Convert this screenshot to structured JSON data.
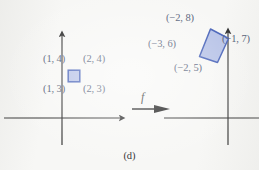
{
  "figure": {
    "caption": "(d)",
    "map_label": "f",
    "background_color": "#f7f7f5",
    "label_color": "#4a5570",
    "axis_color": "#262626",
    "shape_fill_color": "#aebbe4",
    "shape_stroke_color": "#3f5bb5",
    "arrow_color": "#111111"
  },
  "domain_panel": {
    "name": "domain",
    "axes": {
      "x_axis_name": "x-axis",
      "y_axis_name": "y-axis",
      "origin_x": 62,
      "origin_y": 118
    },
    "shape": {
      "name": "unit-square",
      "type": "square",
      "vertices": [
        [
          1,
          3
        ],
        [
          2,
          3
        ],
        [
          2,
          4
        ],
        [
          1,
          4
        ]
      ]
    },
    "vertex_labels": [
      {
        "text": "(1, 4)",
        "point": [
          1,
          4
        ],
        "left": 43,
        "top": 54
      },
      {
        "text": "(2, 4)",
        "point": [
          2,
          4
        ],
        "left": 83,
        "top": 54
      },
      {
        "text": "(1, 3)",
        "point": [
          1,
          3
        ],
        "left": 43,
        "top": 84
      },
      {
        "text": "(2, 3)",
        "point": [
          2,
          3
        ],
        "left": 83,
        "top": 84
      }
    ]
  },
  "codomain_panel": {
    "name": "codomain",
    "axes": {
      "x_axis_name": "x-axis",
      "y_axis_name": "y-axis",
      "origin_x": 228,
      "origin_y": 118
    },
    "shape": {
      "name": "transformed-parallelogram",
      "type": "parallelogram",
      "vertices": [
        [
          -2,
          5
        ],
        [
          -1,
          7
        ],
        [
          -2,
          8
        ],
        [
          -3,
          6
        ]
      ]
    },
    "vertex_labels": [
      {
        "text": "(−2, 8)",
        "point": [
          -2,
          8
        ],
        "left": 166,
        "top": 13
      },
      {
        "text": "(−1, 7)",
        "point": [
          -1,
          7
        ],
        "left": 222,
        "top": 34
      },
      {
        "text": "(−3, 6)",
        "point": [
          -3,
          6
        ],
        "left": 148,
        "top": 39
      },
      {
        "text": "(−2, 5)",
        "point": [
          -2,
          5
        ],
        "left": 174,
        "top": 63
      }
    ]
  }
}
